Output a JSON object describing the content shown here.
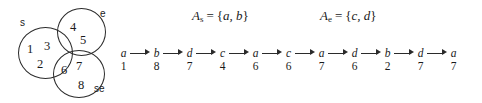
{
  "figure": {
    "diagram_type": "set-partition-and-labeled-sequence",
    "regions": [
      {
        "id": "s",
        "label": "s",
        "elements": [
          "1",
          "3",
          "2"
        ]
      },
      {
        "id": "e",
        "label": "e",
        "elements": [
          "4",
          "5"
        ]
      },
      {
        "id": "se",
        "label": "se",
        "elements": [
          "6",
          "7",
          "8"
        ]
      }
    ],
    "region_elements": {
      "s1": "1",
      "s3": "3",
      "s2": "2",
      "e4": "4",
      "e5": "5",
      "se6": "6",
      "se7": "7",
      "se8": "8"
    },
    "set_definitions": [
      {
        "name": "A",
        "subscript": "s",
        "equals": "=",
        "open": "{",
        "members": "a, b",
        "close": "}"
      },
      {
        "name": "A",
        "subscript": "e",
        "equals": "=",
        "open": "{",
        "members": "c, d",
        "close": "}"
      }
    ],
    "sequence": {
      "arrow_glyph": "→",
      "nodes": [
        {
          "letter": "a",
          "number": "1"
        },
        {
          "letter": "b",
          "number": "8"
        },
        {
          "letter": "d",
          "number": "7"
        },
        {
          "letter": "c",
          "number": "4"
        },
        {
          "letter": "a",
          "number": "6"
        },
        {
          "letter": "c",
          "number": "6"
        },
        {
          "letter": "a",
          "number": "7"
        },
        {
          "letter": "d",
          "number": "6"
        },
        {
          "letter": "b",
          "number": "2"
        },
        {
          "letter": "d",
          "number": "7"
        },
        {
          "letter": "a",
          "number": "7"
        }
      ]
    },
    "colors": {
      "ink": "#1a1a1a",
      "stroke": "#2b2b2b",
      "background": "#ffffff"
    }
  }
}
